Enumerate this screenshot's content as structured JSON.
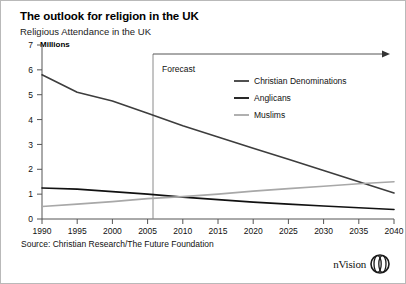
{
  "header": {
    "title": "The outlook for religion in the UK",
    "subtitle": "Religious Attendance in the UK",
    "units_label": "Millions"
  },
  "footer": {
    "source": "Source: Christian Research/The Future Foundation",
    "brand": "nVision",
    "brand_icon": "nvision-circle-logo"
  },
  "annotations": {
    "forecast_label": "Forecast",
    "forecast_start_year": 2005
  },
  "colors": {
    "christian": "#3d3d3d",
    "anglicans": "#111111",
    "muslims": "#a8a8a8",
    "axis": "#555555",
    "border": "#b9b9b9"
  },
  "chart_data": {
    "type": "line",
    "title": "The outlook for religion in the UK",
    "subtitle": "Religious Attendance in the UK",
    "xlabel": "",
    "ylabel": "Millions",
    "ylim": [
      0,
      7
    ],
    "xlim": [
      1990,
      2040
    ],
    "yticks": [
      0,
      1,
      2,
      3,
      4,
      5,
      6,
      7
    ],
    "xticks": [
      1990,
      1995,
      2000,
      2005,
      2010,
      2015,
      2020,
      2025,
      2030,
      2035,
      2040
    ],
    "grid": false,
    "legend_position": "upper-right",
    "x": [
      1990,
      1995,
      2000,
      2005,
      2010,
      2015,
      2020,
      2025,
      2030,
      2035,
      2040
    ],
    "series": [
      {
        "name": "Christian Denominations",
        "color": "#3d3d3d",
        "values": [
          5.8,
          5.1,
          4.75,
          4.25,
          3.75,
          3.3,
          2.85,
          2.4,
          1.95,
          1.5,
          1.05
        ]
      },
      {
        "name": "Anglicans",
        "color": "#111111",
        "values": [
          1.25,
          1.2,
          1.1,
          1.0,
          0.88,
          0.78,
          0.68,
          0.6,
          0.52,
          0.45,
          0.38
        ]
      },
      {
        "name": "Muslims",
        "color": "#a8a8a8",
        "values": [
          0.5,
          0.6,
          0.7,
          0.82,
          0.9,
          1.0,
          1.12,
          1.22,
          1.32,
          1.42,
          1.5
        ]
      }
    ]
  }
}
